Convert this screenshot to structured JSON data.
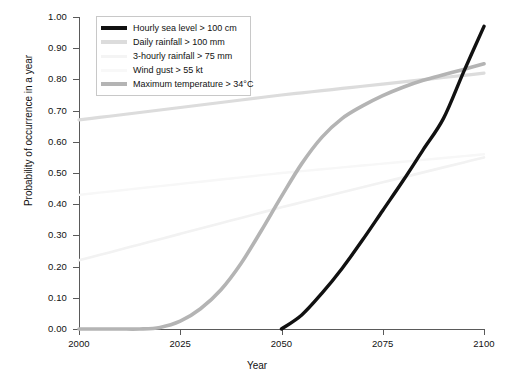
{
  "chart_data": {
    "type": "line",
    "title": "",
    "xlabel": "Year",
    "ylabel": "Probability of occurrence in a year",
    "xlim": [
      2000,
      2100
    ],
    "ylim": [
      0.0,
      1.0
    ],
    "xticks": [
      2000,
      2025,
      2050,
      2075,
      2100
    ],
    "xtick_labels": [
      "2000",
      "2025",
      "2050",
      "2075",
      "2100"
    ],
    "yticks": [
      0.0,
      0.1,
      0.2,
      0.3,
      0.4,
      0.5,
      0.6,
      0.7,
      0.8,
      0.9,
      1.0
    ],
    "ytick_labels": [
      "0.00",
      "0.10",
      "0.20",
      "0.30",
      "0.40",
      "0.50",
      "0.60",
      "0.70",
      "0.80",
      "0.90",
      "1.00"
    ],
    "grid": false,
    "legend_position": "upper left",
    "x": [
      2000,
      2005,
      2010,
      2015,
      2020,
      2025,
      2030,
      2035,
      2040,
      2045,
      2050,
      2055,
      2060,
      2065,
      2070,
      2075,
      2080,
      2085,
      2090,
      2095,
      2100
    ],
    "series": [
      {
        "name": "Hourly sea level > 100 cm",
        "color": "#111111",
        "width": 3.4,
        "values": [
          null,
          null,
          null,
          null,
          null,
          null,
          null,
          null,
          null,
          null,
          0.0,
          0.045,
          0.115,
          0.195,
          0.285,
          0.38,
          0.475,
          0.575,
          0.675,
          0.825,
          0.97
        ]
      },
      {
        "name": "Daily rainfall > 100 mm",
        "color": "#dcdcdc",
        "width": 3.2,
        "values": [
          0.67,
          0.678,
          0.686,
          0.694,
          0.702,
          0.71,
          0.718,
          0.726,
          0.734,
          0.742,
          0.75,
          0.757,
          0.764,
          0.771,
          0.778,
          0.785,
          0.792,
          0.799,
          0.806,
          0.813,
          0.82
        ]
      },
      {
        "name": "3-hourly rainfall > 75 mm",
        "color": "#f2f2f2",
        "width": 2.6,
        "values": [
          0.22,
          0.237,
          0.254,
          0.271,
          0.288,
          0.305,
          0.322,
          0.339,
          0.356,
          0.373,
          0.39,
          0.406,
          0.422,
          0.438,
          0.454,
          0.47,
          0.486,
          0.502,
          0.518,
          0.534,
          0.55
        ]
      },
      {
        "name": "Wind gust > 55 kt",
        "color": "#f7f7f7",
        "width": 2.4,
        "values": [
          0.43,
          0.437,
          0.444,
          0.451,
          0.458,
          0.465,
          0.472,
          0.479,
          0.486,
          0.493,
          0.5,
          0.506,
          0.512,
          0.518,
          0.524,
          0.53,
          0.536,
          0.542,
          0.548,
          0.554,
          0.56
        ]
      },
      {
        "name": "Maximum temperature > 34°C",
        "color": "#b4b4b4",
        "width": 3.6,
        "values": [
          0.0,
          0.0,
          0.0,
          0.0,
          0.005,
          0.025,
          0.065,
          0.125,
          0.21,
          0.315,
          0.425,
          0.53,
          0.615,
          0.675,
          0.715,
          0.748,
          0.775,
          0.797,
          0.815,
          0.832,
          0.85
        ]
      }
    ]
  },
  "legend": {
    "items": [
      {
        "label": "Hourly sea level > 100 cm",
        "color": "#111111",
        "thickness": "4px"
      },
      {
        "label": "Daily rainfall > 100 mm",
        "color": "#dcdcdc",
        "thickness": "4px"
      },
      {
        "label": "3-hourly rainfall > 75 mm",
        "color": "#f4f4f4",
        "thickness": "3px"
      },
      {
        "label": "Wind gust > 55 kt",
        "color": "#f8f8f8",
        "thickness": "3px"
      },
      {
        "label": "Maximum temperature > 34°C",
        "color": "#b4b4b4",
        "thickness": "4px"
      }
    ]
  }
}
